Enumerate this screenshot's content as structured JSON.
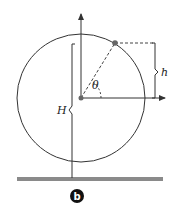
{
  "diagram": {
    "labels": {
      "theta": "θ",
      "h": "h",
      "H": "H",
      "figure_tag": "b"
    },
    "colors": {
      "line": "#333333",
      "dashed": "#444444",
      "ground": "#8a8a8a",
      "point": "#666666",
      "badge": "#111111"
    }
  }
}
